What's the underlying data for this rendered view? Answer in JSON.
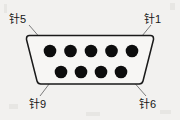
{
  "figure": {
    "kind": "db9-connector-pin-diagram",
    "background_color": "#f2f1ef",
    "ink_color": "#121212",
    "outline_color": "#1a1a1a",
    "pin_color": "#0d0d0d",
    "leader_color": "#6b6b6b"
  },
  "labels": {
    "pin5": "针5",
    "pin1": "针1",
    "pin9": "针9",
    "pin6": "针6"
  },
  "connector": {
    "shape": "trapezoid",
    "rows": [
      {
        "name": "top-row",
        "count": 5,
        "pin_numbers": [
          5,
          4,
          3,
          2,
          1
        ]
      },
      {
        "name": "bottom-row",
        "count": 4,
        "pin_numbers": [
          9,
          8,
          7,
          6
        ]
      }
    ],
    "total_pins": 9
  },
  "leaders": [
    {
      "from_label": "pin5",
      "to_pin": 5,
      "x1": 29,
      "y1": 25,
      "x2": 48,
      "y2": 47
    },
    {
      "from_label": "pin1",
      "to_pin": 1,
      "x1": 151,
      "y1": 25,
      "x2": 133,
      "y2": 47
    },
    {
      "from_label": "pin9",
      "to_pin": 9,
      "x1": 40,
      "y1": 96,
      "x2": 59,
      "y2": 71
    },
    {
      "from_label": "pin6",
      "to_pin": 6,
      "x1": 146,
      "y1": 96,
      "x2": 124,
      "y2": 71
    }
  ]
}
